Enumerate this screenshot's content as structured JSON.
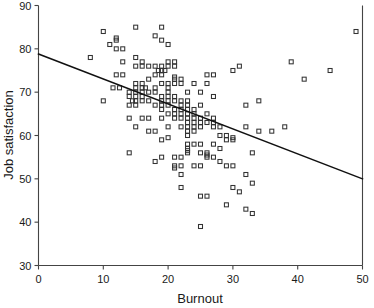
{
  "chart_data": {
    "type": "scatter",
    "title": "",
    "subtitle": "",
    "xlabel": "Burnout",
    "ylabel": "Job satisfaction",
    "xlim": [
      0,
      50
    ],
    "ylim": [
      30,
      90
    ],
    "xticks": [
      0,
      10,
      20,
      30,
      40,
      50
    ],
    "yticks": [
      30,
      40,
      50,
      60,
      70,
      80,
      90
    ],
    "xtick_labels": [
      "0",
      "10",
      "20",
      "30",
      "40",
      "50"
    ],
    "ytick_labels": [
      "30",
      "40",
      "50",
      "60",
      "70",
      "80",
      "90"
    ],
    "grid": false,
    "legend": false,
    "legend_position": "none",
    "marker": "open-square",
    "marker_color": "#333333",
    "series": [
      {
        "name": "Burnout vs Job satisfaction",
        "points": [
          [
            8,
            78
          ],
          [
            10,
            84
          ],
          [
            10,
            68
          ],
          [
            11,
            81
          ],
          [
            12,
            82
          ],
          [
            12,
            82.5
          ],
          [
            12,
            80
          ],
          [
            13,
            80
          ],
          [
            13,
            74
          ],
          [
            13,
            77
          ],
          [
            12,
            74
          ],
          [
            11.5,
            71
          ],
          [
            12.5,
            71
          ],
          [
            14,
            64
          ],
          [
            14,
            56
          ],
          [
            14,
            69
          ],
          [
            14,
            70
          ],
          [
            14.5,
            68
          ],
          [
            14,
            67
          ],
          [
            15,
            85
          ],
          [
            15,
            78
          ],
          [
            15,
            76
          ],
          [
            15,
            72
          ],
          [
            15,
            71
          ],
          [
            15,
            70
          ],
          [
            15,
            69
          ],
          [
            15,
            68
          ],
          [
            15,
            67
          ],
          [
            15,
            62
          ],
          [
            16,
            77
          ],
          [
            16,
            76
          ],
          [
            16,
            72
          ],
          [
            16,
            71
          ],
          [
            16,
            70
          ],
          [
            16,
            69
          ],
          [
            16,
            68
          ],
          [
            16,
            64
          ],
          [
            16.5,
            71
          ],
          [
            17,
            76
          ],
          [
            17,
            73
          ],
          [
            17,
            70
          ],
          [
            17,
            68
          ],
          [
            17,
            64
          ],
          [
            17,
            61
          ],
          [
            18,
            83
          ],
          [
            18,
            76
          ],
          [
            18,
            74
          ],
          [
            18,
            71
          ],
          [
            18,
            70
          ],
          [
            18,
            67
          ],
          [
            18,
            61
          ],
          [
            18,
            54
          ],
          [
            18.5,
            75
          ],
          [
            19,
            85
          ],
          [
            19,
            82
          ],
          [
            19,
            76
          ],
          [
            19,
            75
          ],
          [
            19,
            74
          ],
          [
            19,
            72
          ],
          [
            19,
            69
          ],
          [
            19,
            68
          ],
          [
            19,
            67
          ],
          [
            19,
            66
          ],
          [
            19,
            64
          ],
          [
            19,
            59
          ],
          [
            19,
            55
          ],
          [
            19.5,
            75
          ],
          [
            20,
            81
          ],
          [
            20,
            77
          ],
          [
            20,
            76
          ],
          [
            20,
            72
          ],
          [
            20,
            71
          ],
          [
            20,
            70
          ],
          [
            20,
            69
          ],
          [
            20,
            68
          ],
          [
            20,
            67
          ],
          [
            20,
            65
          ],
          [
            20,
            62
          ],
          [
            20,
            59.5
          ],
          [
            21,
            77
          ],
          [
            21,
            76
          ],
          [
            21,
            73
          ],
          [
            21,
            73.5
          ],
          [
            21,
            72
          ],
          [
            21,
            69
          ],
          [
            21,
            68
          ],
          [
            21,
            66
          ],
          [
            21,
            65
          ],
          [
            21,
            64
          ],
          [
            21,
            55
          ],
          [
            21,
            53
          ],
          [
            21,
            52.5
          ],
          [
            22,
            73
          ],
          [
            22,
            72
          ],
          [
            22,
            68
          ],
          [
            22,
            67
          ],
          [
            22,
            66
          ],
          [
            22,
            65
          ],
          [
            22,
            64
          ],
          [
            22,
            62
          ],
          [
            22,
            55
          ],
          [
            22,
            53
          ],
          [
            22,
            51
          ],
          [
            22,
            48
          ],
          [
            23,
            70
          ],
          [
            23,
            68
          ],
          [
            23,
            67
          ],
          [
            23,
            66
          ],
          [
            23,
            65
          ],
          [
            23,
            64
          ],
          [
            23,
            63
          ],
          [
            23,
            62
          ],
          [
            23,
            61
          ],
          [
            23,
            60
          ],
          [
            23,
            58
          ],
          [
            23,
            57
          ],
          [
            23,
            56.5
          ],
          [
            23,
            56
          ],
          [
            24,
            72
          ],
          [
            24,
            66
          ],
          [
            24,
            65
          ],
          [
            24,
            64
          ],
          [
            24,
            63
          ],
          [
            24,
            62
          ],
          [
            24,
            61
          ],
          [
            24,
            58
          ],
          [
            24,
            53
          ],
          [
            25,
            70
          ],
          [
            25,
            67
          ],
          [
            25,
            64
          ],
          [
            25,
            63
          ],
          [
            25,
            62
          ],
          [
            25,
            58
          ],
          [
            25,
            56
          ],
          [
            25,
            53
          ],
          [
            25,
            46
          ],
          [
            25,
            39
          ],
          [
            26,
            74
          ],
          [
            26,
            72
          ],
          [
            26,
            65
          ],
          [
            26,
            63
          ],
          [
            26,
            56
          ],
          [
            26,
            55
          ],
          [
            26,
            55.5
          ],
          [
            26,
            46
          ],
          [
            27,
            74
          ],
          [
            27,
            69
          ],
          [
            27,
            64
          ],
          [
            27,
            63
          ],
          [
            27,
            62
          ],
          [
            27,
            58
          ],
          [
            27,
            55
          ],
          [
            28,
            62
          ],
          [
            28,
            60
          ],
          [
            28,
            57
          ],
          [
            28,
            54
          ],
          [
            29,
            60
          ],
          [
            29,
            59
          ],
          [
            29,
            53
          ],
          [
            29,
            44
          ],
          [
            30,
            75
          ],
          [
            30,
            59
          ],
          [
            30,
            59.5
          ],
          [
            30,
            53
          ],
          [
            30,
            48
          ],
          [
            31,
            76
          ],
          [
            31,
            47
          ],
          [
            32,
            67
          ],
          [
            32,
            62
          ],
          [
            32,
            51
          ],
          [
            32,
            43
          ],
          [
            33,
            56
          ],
          [
            33,
            49
          ],
          [
            33,
            42
          ],
          [
            34,
            68
          ],
          [
            34,
            61
          ],
          [
            36,
            61
          ],
          [
            38,
            62
          ],
          [
            39,
            77
          ],
          [
            41,
            73
          ],
          [
            45,
            75
          ],
          [
            49,
            84
          ]
        ]
      }
    ],
    "trendline": {
      "name": "linear fit",
      "x_start": 0,
      "y_start": 78.8,
      "x_end": 50,
      "y_end": 50.0,
      "color": "#111111"
    }
  }
}
